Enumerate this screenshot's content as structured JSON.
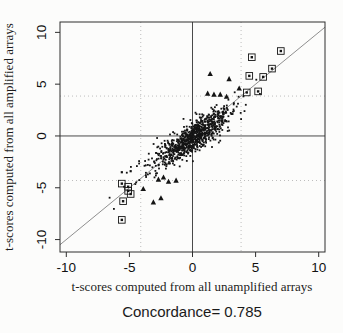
{
  "chart_data": {
    "type": "scatter",
    "title": "",
    "xlabel": "t-scores computed from all unamplified arrays",
    "ylabel": "t-scores computed from all amplified arrays",
    "caption": "Concordance= 0.785",
    "concordance_value": 0.785,
    "xlim": [
      -10.5,
      10.5
    ],
    "ylim": [
      -11.2,
      11.0
    ],
    "x_ticks": [
      -10,
      -5,
      0,
      5,
      10
    ],
    "y_ticks": [
      -10,
      -5,
      0,
      5,
      10
    ],
    "grid": "off",
    "legend": "none",
    "reference_lines": {
      "vertical_zero_x": 0,
      "horizontal_zero_y": 0,
      "identity_line": "y = x"
    },
    "threshold_lines_dotted": {
      "x_values": [
        -4.1,
        3.85
      ],
      "y_values": [
        -4.3,
        3.85
      ]
    },
    "cloud": {
      "description": "dense cluster of ~850 small points centered near origin, elongated along the identity line, correlation ~0.8",
      "n": 850,
      "seed": 11,
      "spine_sd": 1.35,
      "noise_x": 0.55,
      "noise_y": 0.6,
      "tail_fraction": 0.07,
      "tail_scale": 2.1,
      "y_gain": 0.88,
      "y_offset": -0.15
    },
    "boxed_outlier_points": [
      [
        7.0,
        8.2
      ],
      [
        4.7,
        7.6
      ],
      [
        6.3,
        6.5
      ],
      [
        5.6,
        5.7
      ],
      [
        4.5,
        5.8
      ],
      [
        5.2,
        4.3
      ],
      [
        4.3,
        4.2
      ],
      [
        -5.6,
        -4.6
      ],
      [
        -5.1,
        -4.9
      ],
      [
        -5.1,
        -5.3
      ],
      [
        -4.9,
        -5.6
      ],
      [
        -5.5,
        -6.3
      ],
      [
        -5.6,
        -8.1
      ]
    ],
    "triangle_points": [
      [
        1.4,
        6.0
      ],
      [
        2.9,
        5.5
      ],
      [
        3.7,
        4.6
      ],
      [
        1.2,
        4.1
      ],
      [
        1.7,
        4.0
      ],
      [
        2.2,
        4.0
      ],
      [
        2.7,
        3.8
      ],
      [
        -3.9,
        -5.1
      ],
      [
        -3.1,
        -6.4
      ],
      [
        -2.5,
        -6.0
      ],
      [
        -2.7,
        -4.2
      ],
      [
        -2.3,
        -4.0
      ],
      [
        -1.9,
        -4.4
      ],
      [
        -1.3,
        -4.3
      ]
    ],
    "isolated_points": [
      [
        -5.6,
        -3.5
      ],
      [
        -4.9,
        -3.4
      ]
    ],
    "colors": {
      "point": "#141414",
      "frame": "#2e2e2e",
      "zero_line": "#4a4a4a",
      "identity_line": "#8f8f8f",
      "dotted_threshold": "#bdbdbd",
      "background": "#fcfcfb",
      "text": "#1a1a1a"
    }
  }
}
